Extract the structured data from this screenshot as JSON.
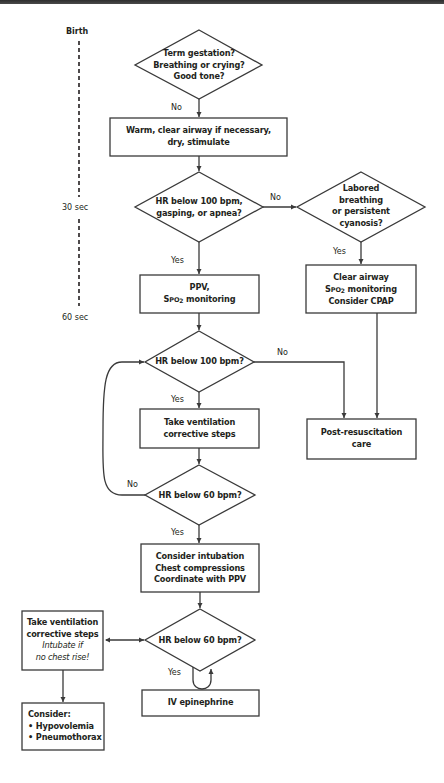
{
  "timeline": {
    "labels": [
      "Birth",
      "30 sec",
      "60 sec"
    ]
  },
  "nodes": {
    "initial_assessment": {
      "type": "decision",
      "lines": [
        "Term gestation?",
        "Breathing or crying?",
        "Good tone?"
      ]
    },
    "initial_steps": {
      "type": "action",
      "lines": [
        "Warm, clear airway if necessary,",
        "dry, stimulate"
      ]
    },
    "hr_gasping_apnea": {
      "type": "decision",
      "lines": [
        "HR below 100 bpm,",
        "gasping, or apnea?"
      ]
    },
    "labored_breathing": {
      "type": "decision",
      "lines": [
        "Labored",
        "breathing",
        "or persistent",
        "cyanosis?"
      ]
    },
    "ppv": {
      "type": "action",
      "line1": "PPV,",
      "line2_prefix": "S",
      "line2_smallcaps": "PO",
      "line2_sub": "2",
      "line2_suffix": " monitoring"
    },
    "clear_airway": {
      "type": "action",
      "line1": "Clear airway",
      "line2_prefix": "S",
      "line2_smallcaps": "PO",
      "line2_sub": "2",
      "line2_suffix": " monitoring",
      "line3": "Consider CPAP"
    },
    "hr_below_100": {
      "type": "decision",
      "lines": [
        "HR below 100 bpm?"
      ]
    },
    "ventilation_corrective": {
      "type": "action",
      "lines": [
        "Take ventilation",
        "corrective steps"
      ]
    },
    "post_resuscitation": {
      "type": "action",
      "lines": [
        "Post-resuscitation",
        "care"
      ]
    },
    "hr_below_60_a": {
      "type": "decision",
      "lines": [
        "HR below 60 bpm?"
      ]
    },
    "intubation_compressions": {
      "type": "action",
      "lines": [
        "Consider intubation",
        "Chest compressions",
        "Coordinate with PPV"
      ]
    },
    "hr_below_60_b": {
      "type": "decision",
      "lines": [
        "HR below 60 bpm?"
      ]
    },
    "ventilation_corrective_intubate": {
      "type": "action",
      "lines": [
        "Take ventilation",
        "corrective steps"
      ],
      "italic_lines": [
        "Intubate if",
        "no chest rise!"
      ]
    },
    "iv_epinephrine": {
      "type": "action",
      "lines": [
        "IV epinephrine"
      ]
    },
    "consider": {
      "type": "action",
      "title": "Consider:",
      "bullets": [
        "• Hypovolemia",
        "• Pneumothorax"
      ]
    }
  },
  "edges": {
    "initial_no": "No",
    "hr_gasping_no": "No",
    "hr_gasping_yes": "Yes",
    "labored_yes": "Yes",
    "hr100_no": "No",
    "hr100_yes": "Yes",
    "hr60a_no": "No",
    "hr60a_yes": "Yes",
    "hr60b_yes": "Yes"
  },
  "colors": {
    "stroke": "#3a3a3a",
    "text": "#231f20",
    "background": "#ffffff",
    "topbar": "#3c3c3c"
  }
}
